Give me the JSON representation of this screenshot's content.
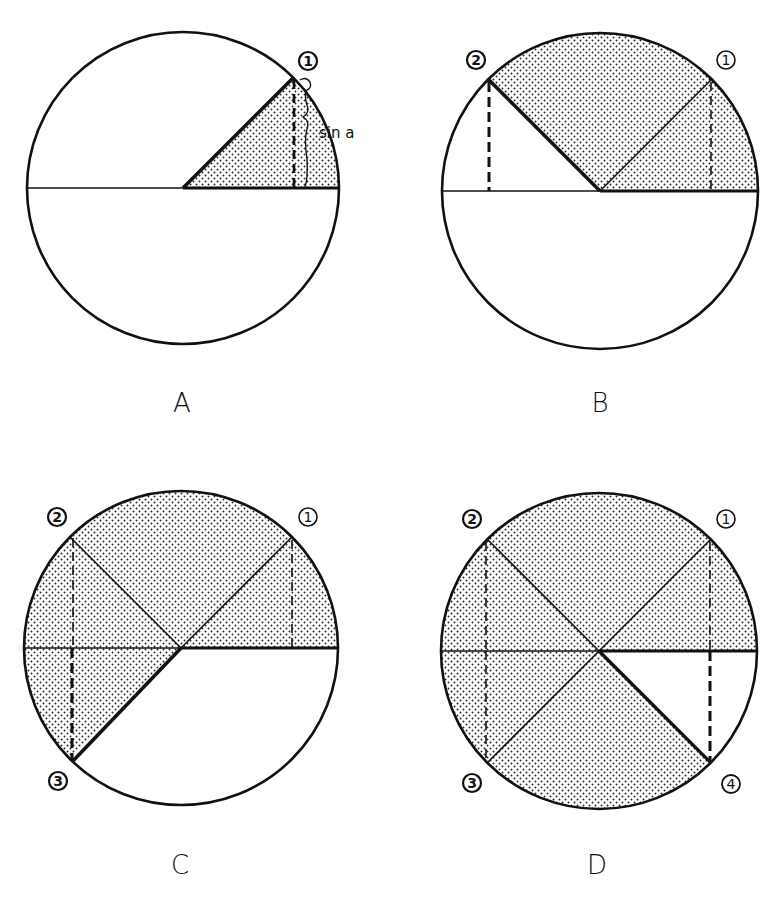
{
  "figure": {
    "background": "#ffffff",
    "ink": "#111111",
    "panels": [
      {
        "id": "A",
        "label": "A",
        "points": [
          "1"
        ],
        "annotation": "sin a"
      },
      {
        "id": "B",
        "label": "B",
        "points": [
          "2",
          "1"
        ]
      },
      {
        "id": "C",
        "label": "C",
        "points": [
          "2",
          "1",
          "3"
        ]
      },
      {
        "id": "D",
        "label": "D",
        "points": [
          "2",
          "1",
          "3",
          "4"
        ]
      }
    ]
  }
}
